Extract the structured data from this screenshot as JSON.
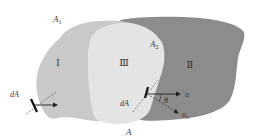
{
  "diagram": {
    "regions": [
      {
        "id": "I",
        "label": "I",
        "color": "#c9c9c9"
      },
      {
        "id": "II",
        "label": "Ⅱ",
        "color": "#8c8c8c"
      },
      {
        "id": "III",
        "label": "Ⅲ",
        "color": "#e4e4e4"
      }
    ],
    "boundary_labels": {
      "a1": "A",
      "a1_sub": "1",
      "a2": "A",
      "a2_sub": "2",
      "a": "A"
    },
    "left_element": {
      "label": "dA"
    },
    "right_element": {
      "label": "dA",
      "velocity": "u",
      "normal": "u",
      "normal_sub": "n",
      "angle": "θ"
    }
  }
}
